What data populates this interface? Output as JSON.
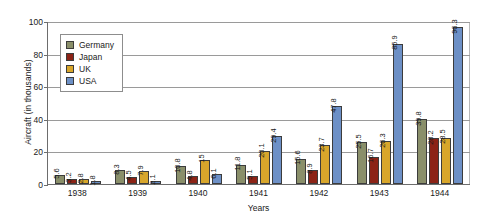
{
  "chart_data": {
    "type": "bar",
    "title": "",
    "xlabel": "Years",
    "ylabel": "Aircraft (in thousands)",
    "categories": [
      "1938",
      "1939",
      "1940",
      "1941",
      "1942",
      "1943",
      "1944"
    ],
    "ylim": [
      0,
      100
    ],
    "y_ticks": [
      0,
      20,
      40,
      60,
      80,
      100
    ],
    "grid": true,
    "legend_position": "upper-left-inside",
    "series": [
      {
        "name": "Germany",
        "color": "#8a8f6a",
        "values": [
          5.6,
          8.3,
          10.8,
          11.8,
          15.6,
          25.5,
          39.8
        ],
        "labels": [
          "5.6",
          "8.3",
          "10.8",
          "11.8",
          "15.6",
          "25.5",
          "39.8"
        ]
      },
      {
        "name": "Japan",
        "color": "#8c2316",
        "values": [
          3.2,
          4.5,
          4.8,
          5.1,
          8.9,
          16.7,
          28.2
        ],
        "labels": [
          "3.2",
          "4.5",
          "4.8",
          "5.1",
          "8.9",
          "16.7",
          "28.2"
        ]
      },
      {
        "name": "UK",
        "color": "#d8a62b",
        "values": [
          2.8,
          7.9,
          15,
          20.1,
          23.7,
          26.3,
          28.5
        ],
        "labels": [
          "2.8",
          "7.9",
          "15",
          "20.1",
          "23.7",
          "26.3",
          "28.5"
        ]
      },
      {
        "name": "USA",
        "color": "#6d90c6",
        "values": [
          1.8,
          2.1,
          6.1,
          29.4,
          47.8,
          85.9,
          96.3
        ],
        "labels": [
          "1.8",
          "2.1",
          "6.1",
          "29.4",
          "47.8",
          "85.9",
          "96.3"
        ]
      }
    ]
  }
}
